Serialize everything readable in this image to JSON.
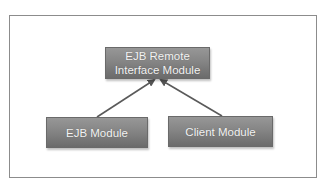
{
  "diagram": {
    "type": "dependency-diagram",
    "nodes": [
      {
        "id": "remote",
        "lines": [
          "EJB Remote",
          "Interface Module"
        ]
      },
      {
        "id": "ejb",
        "lines": [
          "EJB Module"
        ]
      },
      {
        "id": "client",
        "lines": [
          "Client Module"
        ]
      }
    ],
    "edges": [
      {
        "from": "ejb",
        "to": "remote"
      },
      {
        "from": "client",
        "to": "remote"
      }
    ],
    "colors": {
      "node_fill_top": "#979797",
      "node_fill_bottom": "#6b6b6b",
      "node_text": "#f4f4f4",
      "arrow": "#5a5a5a",
      "frame_border": "#8c8c8c"
    }
  }
}
